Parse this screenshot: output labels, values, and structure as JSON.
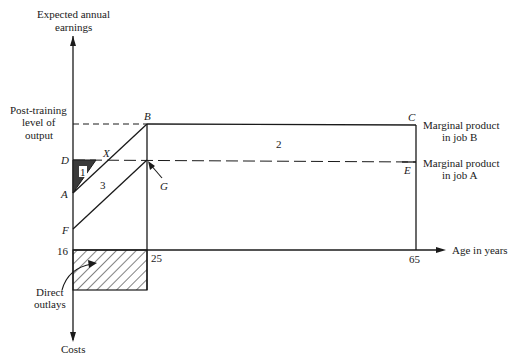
{
  "axes": {
    "y_label_line1": "Expected annual",
    "y_label_line2": "earnings",
    "x_label": "Age in years",
    "y_neg_label": "Costs"
  },
  "levels": {
    "post_training_line1": "Post-training",
    "post_training_line2": "level of",
    "post_training_line3": "output"
  },
  "points": {
    "A": "A",
    "B": "B",
    "C": "C",
    "D": "D",
    "E": "E",
    "F": "F",
    "G": "G",
    "X": "X"
  },
  "ticks": {
    "age_start": "16",
    "age_training_end": "25",
    "age_retire": "65"
  },
  "areas": {
    "area1": "1",
    "area2": "2",
    "area3": "3"
  },
  "right_labels": {
    "job_b_line1": "Marginal product",
    "job_b_line2": "in job B",
    "job_a_line1": "Marginal product",
    "job_a_line2": "in job A"
  },
  "outlays": {
    "line1": "Direct",
    "line2": "outlays"
  },
  "colors": {
    "ink": "#1a1a1a",
    "shade": "#3a3a3a"
  }
}
